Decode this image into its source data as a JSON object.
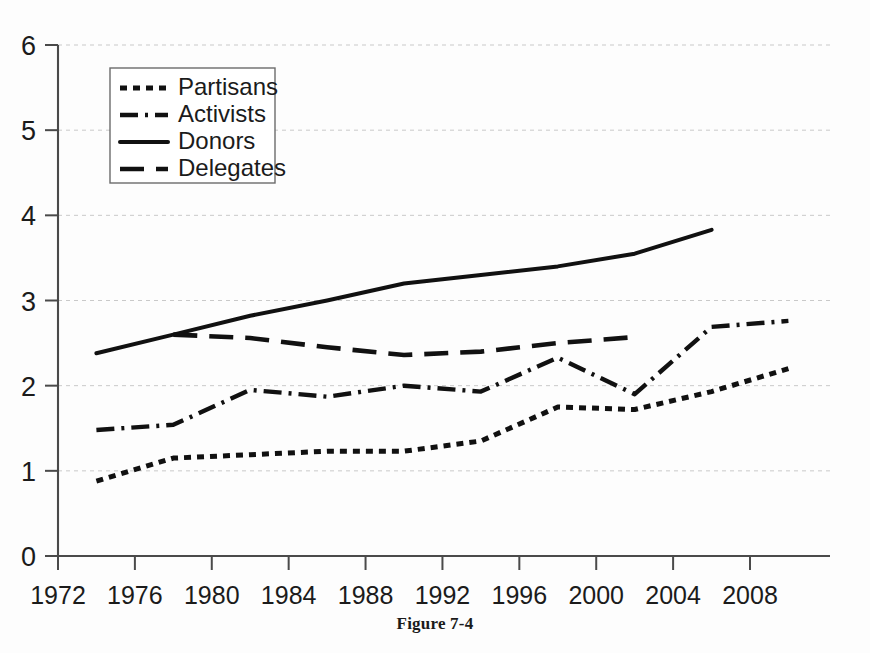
{
  "caption": "Figure 7-4",
  "chart_data": {
    "type": "line",
    "title": "",
    "subtitle": "",
    "xlabel": "",
    "ylabel": "",
    "xlim": [
      1972,
      2010
    ],
    "ylim": [
      0,
      6
    ],
    "ytick_values": [
      0,
      1,
      2,
      3,
      4,
      5,
      6
    ],
    "ytick_labels": [
      "0",
      "1",
      "2",
      "3",
      "4",
      "5",
      "6"
    ],
    "xtick_values": [
      1972,
      1976,
      1980,
      1984,
      1988,
      1992,
      1996,
      2000,
      2004,
      2008
    ],
    "xtick_labels": [
      "1972",
      "1976",
      "1980",
      "1984",
      "1988",
      "1992",
      "1996",
      "2000",
      "2004",
      "2008"
    ],
    "grid": "horizontal-dashed",
    "legend_position": "upper-left",
    "series": [
      {
        "name": "Partisans",
        "style": "dotted",
        "dash": "7 6",
        "width": 5.0,
        "x": [
          1974,
          1978,
          1982,
          1986,
          1990,
          1994,
          1998,
          2002,
          2006,
          2010
        ],
        "values": [
          0.88,
          1.15,
          1.19,
          1.23,
          1.23,
          1.35,
          1.75,
          1.72,
          1.93,
          2.2
        ]
      },
      {
        "name": "Activists",
        "style": "dash-dot",
        "dash": "18 7 3 7",
        "width": 4.4,
        "x": [
          1974,
          1978,
          1982,
          1986,
          1990,
          1994,
          1998,
          2002,
          2006,
          2010
        ],
        "values": [
          1.48,
          1.54,
          1.95,
          1.87,
          2.0,
          1.93,
          2.33,
          1.9,
          2.69,
          2.76
        ]
      },
      {
        "name": "Donors",
        "style": "solid",
        "dash": "none",
        "width": 4.0,
        "x": [
          1974,
          1978,
          1982,
          1986,
          1990,
          1994,
          1998,
          2002,
          2006
        ],
        "values": [
          2.38,
          2.6,
          2.82,
          3.0,
          3.2,
          3.3,
          3.4,
          3.55,
          3.83
        ]
      },
      {
        "name": "Delegates",
        "style": "dashed",
        "dash": "24 12",
        "width": 4.6,
        "x": [
          1978,
          1982,
          1986,
          1990,
          1994,
          1998,
          2002
        ],
        "values": [
          2.6,
          2.56,
          2.45,
          2.36,
          2.4,
          2.5,
          2.57
        ]
      }
    ]
  },
  "legend": {
    "items": [
      {
        "label": "Partisans"
      },
      {
        "label": "Activists"
      },
      {
        "label": "Donors"
      },
      {
        "label": "Delegates"
      }
    ]
  },
  "colors": {
    "ink": "#111111",
    "grid": "#c9c9c9",
    "axis": "#4a4a4a",
    "background": "#fdfdfd"
  }
}
